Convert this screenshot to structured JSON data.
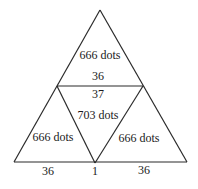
{
  "diagram": {
    "line_color": "#2a2a2a",
    "regions": {
      "top": "666 dots",
      "center": "703 dots",
      "bottom_left": "666 dots",
      "bottom_right": "666 dots"
    },
    "edge_labels": {
      "top_triangle_base": "36",
      "center_triangle_top": "37",
      "bottom_left_base": "36",
      "bottom_gap": "1",
      "bottom_right_base": "36"
    }
  }
}
